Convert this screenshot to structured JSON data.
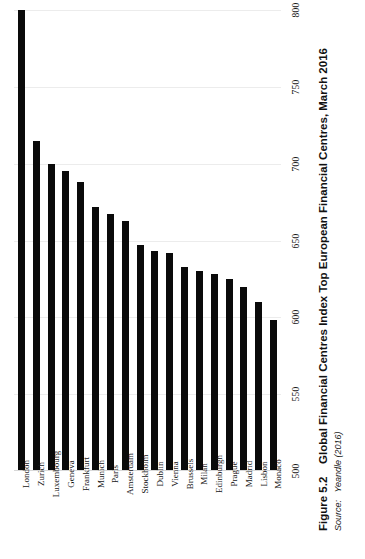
{
  "caption": {
    "figure_number": "Figure 5.2",
    "title": "Global Financial Centres Index Top European Financial Centres, March 2016",
    "source_label": "Source:",
    "source_text": "Yeandle (2016)"
  },
  "chart_data": {
    "type": "bar",
    "title": "Global Financial Centres Index Top European Financial Centres, March 2016",
    "xlabel": "",
    "ylabel": "",
    "ylim": [
      500,
      800
    ],
    "yticks": [
      500,
      550,
      600,
      650,
      700,
      750,
      800
    ],
    "grid": true,
    "legend": "none",
    "orientation": "vertical-bars-rotated-page",
    "bar_color": "#0a0a0a",
    "categories": [
      "London",
      "Zurich",
      "Luxembourg",
      "Geneva",
      "Frankfurt",
      "Munich",
      "Paris",
      "Amsterdam",
      "Stockholm",
      "Dublin",
      "Vienna",
      "Brussels",
      "Milan",
      "Edinburgh",
      "Prague",
      "Madrid",
      "Lisbon",
      "Monaco"
    ],
    "values": [
      800,
      715,
      700,
      695,
      688,
      672,
      667,
      663,
      647,
      643,
      642,
      633,
      630,
      628,
      625,
      620,
      610,
      598
    ]
  }
}
